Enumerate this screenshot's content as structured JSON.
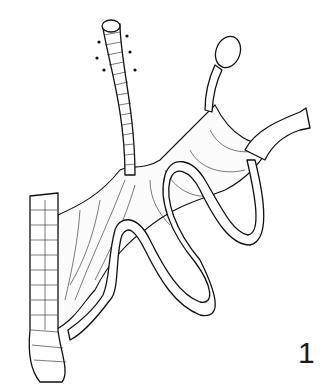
{
  "figure": {
    "number_label": "1",
    "parts": [
      "vascular-pedicle-tube",
      "disc-stoma",
      "mesentery",
      "small-bowel-loops",
      "colon-segment"
    ],
    "colors": {
      "line": "#111111",
      "background": "#ffffff"
    }
  }
}
